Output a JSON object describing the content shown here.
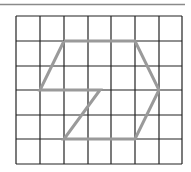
{
  "figure": {
    "top_rule": {
      "x1": 0,
      "x2": 185,
      "y": 4.5,
      "color": "#8a8a8a",
      "width": 1.5
    },
    "grid": {
      "cols": 7,
      "rows": 6,
      "x_lines": [
        16,
        40,
        64,
        88,
        111,
        135,
        159,
        182
      ],
      "y_lines": [
        16,
        41,
        66,
        90,
        115,
        139,
        164
      ],
      "line_color": "#222222",
      "line_width": 1.2
    },
    "shape": {
      "description": "hexagon-like figure with a Z-shaped cut",
      "stroke": "#9a9a9a",
      "stroke_width": 3,
      "points": [
        [
          64,
          41
        ],
        [
          135,
          41
        ],
        [
          159,
          90
        ],
        [
          135,
          139
        ],
        [
          64,
          139
        ],
        [
          100,
          90
        ],
        [
          40,
          90
        ],
        [
          64,
          41
        ]
      ]
    }
  }
}
